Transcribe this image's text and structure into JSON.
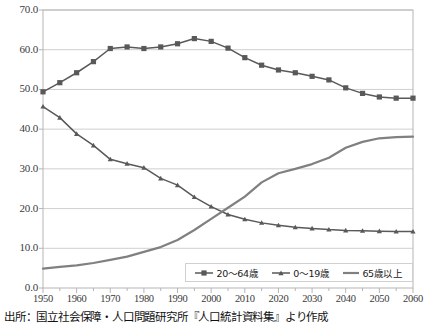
{
  "chart_data": {
    "type": "line",
    "title": "",
    "subtitle": "",
    "xlabel": "",
    "ylabel": "",
    "xlim": [
      1950,
      2060
    ],
    "ylim": [
      0.0,
      70.0
    ],
    "ytick_step": 10.0,
    "xtick_step": 10,
    "minor_xtick_step": 5,
    "grid": "horizontal",
    "legend_position": "bottom-center",
    "x": [
      1950,
      1955,
      1960,
      1965,
      1970,
      1975,
      1980,
      1985,
      1990,
      1995,
      2000,
      2005,
      2010,
      2015,
      2020,
      2025,
      2030,
      2035,
      2040,
      2045,
      2050,
      2055,
      2060
    ],
    "ytick_labels": [
      "0.0",
      "10.0",
      "20.0",
      "30.0",
      "40.0",
      "50.0",
      "60.0",
      "70.0"
    ],
    "xtick_labels": [
      "1950",
      "1960",
      "1970",
      "1980",
      "1990",
      "2000",
      "2010",
      "2020",
      "2030",
      "2040",
      "2050",
      "2060"
    ],
    "series": [
      {
        "name": "20〜64歳",
        "marker": "square",
        "color": "#595959",
        "values": [
          49.4,
          51.7,
          54.2,
          57.0,
          60.3,
          60.7,
          60.3,
          60.7,
          61.5,
          62.8,
          62.1,
          60.4,
          58.0,
          56.1,
          54.9,
          54.2,
          53.3,
          52.4,
          50.4,
          49.0,
          48.1,
          47.8,
          47.8
        ]
      },
      {
        "name": "0〜19歳",
        "marker": "triangle",
        "color": "#595959",
        "values": [
          45.7,
          42.9,
          38.8,
          35.9,
          32.4,
          31.3,
          30.3,
          27.6,
          25.9,
          22.9,
          20.5,
          18.5,
          17.3,
          16.4,
          15.8,
          15.3,
          15.0,
          14.7,
          14.5,
          14.4,
          14.3,
          14.2,
          14.2
        ]
      },
      {
        "name": "65歳以上",
        "marker": "none",
        "color": "#808080",
        "values": [
          4.9,
          5.3,
          5.7,
          6.3,
          7.1,
          7.9,
          9.1,
          10.3,
          12.1,
          14.6,
          17.4,
          20.2,
          23.0,
          26.6,
          28.9,
          30.0,
          31.2,
          32.8,
          35.3,
          36.8,
          37.7,
          38.0,
          38.1
        ]
      }
    ]
  },
  "legend": {
    "entries": [
      {
        "label": "20〜64歳",
        "marker": "square",
        "color": "#595959"
      },
      {
        "label": "0〜19歳",
        "marker": "triangle",
        "color": "#595959"
      },
      {
        "label": "65歳以上",
        "marker": "none",
        "color": "#808080"
      }
    ]
  },
  "caption": {
    "text": "出所：国立社会保障・人口問題研究所『人口統計資料集』より作成"
  },
  "colors": {
    "series_dark": "#595959",
    "series_light": "#808080",
    "gridline": "#cfcfcf",
    "axis": "#b5b5b5",
    "text": "#3a3a3a"
  }
}
